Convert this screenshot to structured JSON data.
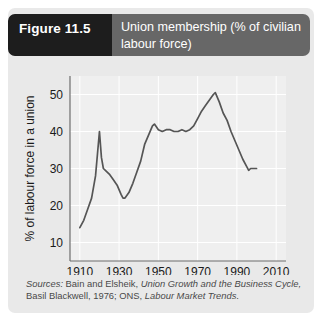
{
  "figure": {
    "number_label": "Figure 11.5",
    "title": "Union membership (% of civilian labour force)",
    "title_line1": "Union membership (% of civilian",
    "title_line2": "labour force)"
  },
  "source": {
    "line1_prefix": "Sources:",
    "line1_plain": " Bain and Elsheik, ",
    "line1_italic": "Union Growth and the Business Cycle,",
    "line2_plain": "Basil Blackwell, 1976; ONS, ",
    "line2_italic": "Labour Market Trends",
    "line2_suffix": ".",
    "full_text": "Sources: Bain and Elsheik, Union Growth and the Business Cycle, Basil Blackwell, 1976; ONS, Labour Market Trends."
  },
  "colors": {
    "panel_background": "#e9e9e9",
    "header_background": "#676767",
    "figure_number_background": "#1d1d1d",
    "header_text": "#ffffff",
    "plot_background": "#efefef",
    "gridline": "#ffffff",
    "axis": "#6d6d6d",
    "data_line": "#555555",
    "tick_text": "#1a1a1a",
    "source_text": "#4a4a4a"
  },
  "chart_data": {
    "type": "line",
    "title": "Union membership (% of civilian labour force)",
    "xlabel": "",
    "ylabel": "% of labour force in a union",
    "xlim": [
      1905,
      2015
    ],
    "ylim": [
      5,
      55
    ],
    "xticks": [
      1910,
      1930,
      1950,
      1970,
      1990,
      2010
    ],
    "yticks": [
      10,
      20,
      30,
      40,
      50
    ],
    "xtick_labels": [
      "1910",
      "1930",
      "1950",
      "1970",
      "1990",
      "2010"
    ],
    "ytick_labels": [
      "10",
      "20",
      "30",
      "40",
      "50"
    ],
    "grid": true,
    "legend": false,
    "series": [
      {
        "name": "Union membership",
        "x": [
          1910,
          1912,
          1914,
          1916,
          1918,
          1919,
          1920,
          1921,
          1922,
          1923,
          1925,
          1927,
          1929,
          1931,
          1932,
          1933,
          1935,
          1937,
          1939,
          1941,
          1943,
          1945,
          1947,
          1948,
          1950,
          1952,
          1954,
          1956,
          1958,
          1960,
          1962,
          1964,
          1966,
          1968,
          1970,
          1972,
          1974,
          1976,
          1978,
          1979,
          1981,
          1983,
          1985,
          1987,
          1989,
          1991,
          1993,
          1995,
          1996,
          1997,
          1998,
          1999,
          2000
        ],
        "y": [
          14.0,
          16.0,
          19.0,
          22.0,
          28.0,
          34.0,
          40.0,
          33.0,
          30.0,
          29.5,
          28.5,
          27.0,
          25.5,
          23.0,
          22.0,
          22.0,
          23.5,
          26.0,
          29.0,
          32.0,
          36.5,
          39.0,
          41.5,
          42.0,
          40.5,
          40.0,
          40.5,
          40.5,
          40.0,
          40.0,
          40.5,
          40.0,
          40.5,
          41.5,
          43.5,
          45.5,
          47.0,
          48.5,
          50.0,
          50.5,
          48.0,
          45.0,
          43.0,
          40.0,
          37.5,
          35.0,
          32.5,
          30.5,
          29.5,
          30.0,
          30.0,
          30.0,
          30.0
        ]
      }
    ]
  }
}
